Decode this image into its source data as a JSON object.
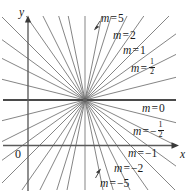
{
  "figure": {
    "background_color": "#ffffff",
    "ink_color": "#1a1a1a",
    "line_color": "#6f6f6f",
    "axis_color": "#4a4a4a",
    "width": 195,
    "height": 191
  },
  "axes": {
    "y_label": "y",
    "x_label": "x",
    "origin_label": "0",
    "y_axis_x": 28,
    "x_axis_y": 145.5
  },
  "pencil": {
    "center_x": 85,
    "center_y": 100,
    "horizontal_line_y": 100
  },
  "labels": {
    "m5": {
      "m": "m",
      "eq": "=",
      "value": "5",
      "x": 101,
      "y": 13
    },
    "m2": {
      "m": "m",
      "eq": "=",
      "value": "2",
      "x": 113,
      "y": 30
    },
    "m1": {
      "m": "m",
      "eq": "=",
      "value": "1",
      "x": 123,
      "y": 45
    },
    "mhalf": {
      "m": "m",
      "eq": "=",
      "num": "1",
      "den": "2",
      "x": 131,
      "y": 61
    },
    "m0": {
      "m": "m",
      "eq": "=",
      "value": "0",
      "x": 142,
      "y": 103
    },
    "mneghalf": {
      "m": "m",
      "eq": "=",
      "sign": "−",
      "num": "1",
      "den": "2",
      "x": 133,
      "y": 124
    },
    "mneg1": {
      "m": "m",
      "eq": "=",
      "value": "−1",
      "x": 128,
      "y": 148
    },
    "mneg2": {
      "m": "m",
      "eq": "=",
      "value": "−2",
      "x": 114,
      "y": 163
    },
    "mneg5": {
      "m": "m",
      "eq": "=",
      "value": "−5",
      "x": 100,
      "y": 178
    }
  },
  "chart_data": {
    "type": "line",
    "xlabel": "x",
    "ylabel": "y",
    "grid": false,
    "legend": "inline-annotations",
    "center_point_pixel": [
      85,
      100
    ],
    "labeled_slopes": [
      "5",
      "2",
      "1",
      "1/2",
      "0",
      "-1/2",
      "-1",
      "-2",
      "-5"
    ],
    "series": [
      {
        "name": "m = 5",
        "slope": 5,
        "angle_deg": 78.7
      },
      {
        "name": "m = 2",
        "slope": 2,
        "angle_deg": 63.4
      },
      {
        "name": "m = 1",
        "slope": 1,
        "angle_deg": 45.0
      },
      {
        "name": "m = 1/2",
        "slope": 0.5,
        "angle_deg": 26.6
      },
      {
        "name": "m = 0",
        "slope": 0,
        "angle_deg": 0.0
      },
      {
        "name": "m = -1/2",
        "slope": -0.5,
        "angle_deg": -26.6
      },
      {
        "name": "m = -1",
        "slope": -1,
        "angle_deg": -45.0
      },
      {
        "name": "m = -2",
        "slope": -2,
        "angle_deg": -63.4
      },
      {
        "name": "m = -5",
        "slope": -5,
        "angle_deg": -78.7
      },
      {
        "name": "intermediate-a",
        "slope": 3.2,
        "angle_deg": 72.6
      },
      {
        "name": "intermediate-b",
        "slope": 1.43,
        "angle_deg": 55.0
      },
      {
        "name": "intermediate-c",
        "slope": 0.73,
        "angle_deg": 36.0
      },
      {
        "name": "intermediate-d",
        "slope": 0.25,
        "angle_deg": 14.0
      },
      {
        "name": "intermediate-e",
        "slope": -0.25,
        "angle_deg": -14.0
      },
      {
        "name": "intermediate-f",
        "slope": -0.73,
        "angle_deg": -36.0
      },
      {
        "name": "intermediate-g",
        "slope": -1.43,
        "angle_deg": -55.0
      },
      {
        "name": "intermediate-h",
        "slope": -3.2,
        "angle_deg": -72.6
      },
      {
        "name": "vertical",
        "slope": null,
        "angle_deg": 90.0
      }
    ]
  }
}
